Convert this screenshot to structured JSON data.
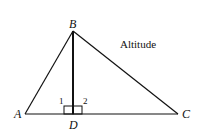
{
  "diagram": {
    "title": "Altitude",
    "vertices": {
      "A": {
        "label": "A",
        "x": 25,
        "y": 114
      },
      "B": {
        "label": "B",
        "x": 73,
        "y": 31
      },
      "C": {
        "label": "C",
        "x": 178,
        "y": 114
      },
      "D": {
        "label": "D",
        "x": 73,
        "y": 114
      }
    },
    "angle_labels": {
      "one": "1",
      "two": "2"
    },
    "segments": [
      "AB",
      "BC",
      "AC",
      "BD"
    ],
    "right_angle_marks": [
      "BDA",
      "BDC"
    ],
    "colors": {
      "stroke": "#111111",
      "background": "#ffffff"
    }
  }
}
